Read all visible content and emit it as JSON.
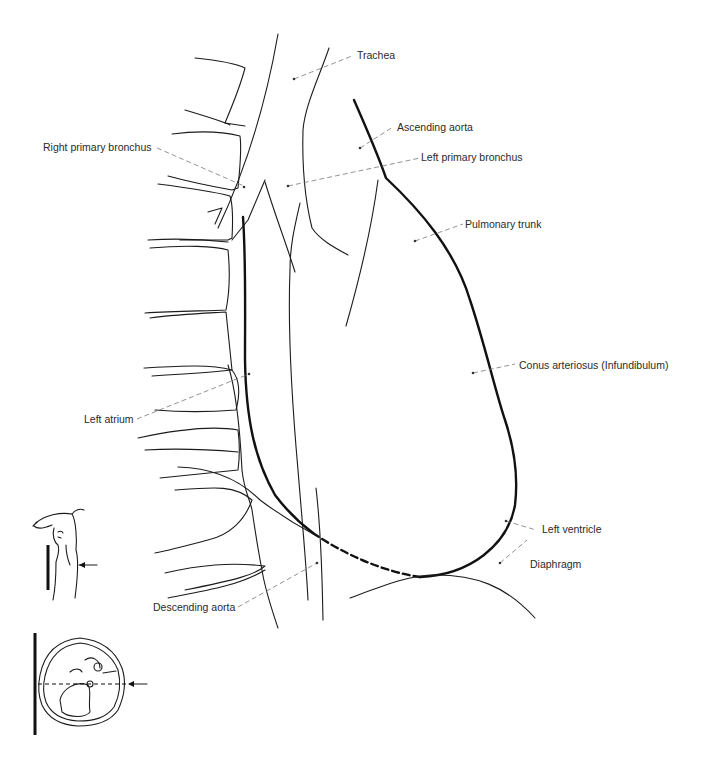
{
  "figure": {
    "labels": {
      "trachea": "Trachea",
      "ascending_aorta": "Ascending aorta",
      "right_primary_bronchus": "Right primary bronchus",
      "left_primary_bronchus": "Left primary bronchus",
      "pulmonary_trunk": "Pulmonary trunk",
      "conus_arteriosus": "Conus arteriosus (Infundibulum)",
      "left_atrium": "Left atrium",
      "left_ventricle": "Left ventricle",
      "diaphragm": "Diaphragm",
      "descending_aorta": "Descending aorta"
    },
    "icons": {
      "patient_position": "patient-lateral-position-icon",
      "cross_section": "thorax-cross-section-icon"
    },
    "colors": {
      "line": "#1c1c1c",
      "leader": "#777777",
      "text": "#2a2a2a",
      "background": "#ffffff"
    }
  }
}
